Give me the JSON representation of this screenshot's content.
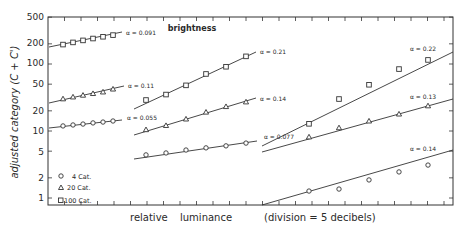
{
  "chart_data": {
    "type": "scatter",
    "title": "brightness",
    "xlabel": "relative luminance (division = 5 decibels)",
    "ylabel": "adjusted category (C + C')",
    "y_scale": "log",
    "ylim": [
      0.8,
      500
    ],
    "y_ticks": [
      1,
      2,
      5,
      10,
      20,
      50,
      100,
      200,
      500
    ],
    "y_tick_labels": [
      "1",
      "2",
      "5",
      "10",
      "20",
      "50",
      "100",
      "200",
      "500"
    ],
    "x_tick_spacing_db": 5,
    "grid": false,
    "legend": {
      "position": "lower-left",
      "entries": [
        {
          "marker": "circle",
          "label": "4 Cat."
        },
        {
          "marker": "triangle",
          "label": "20 Cat."
        },
        {
          "marker": "square",
          "label": "100 Cat."
        }
      ]
    },
    "panels": [
      {
        "name": "panel-1",
        "series": [
          {
            "name": "100 Cat.",
            "marker": "square",
            "alpha_label": "α = 0.091",
            "x_division": [
              1,
              2,
              3,
              4,
              5,
              6
            ],
            "values": [
              195,
              210,
              225,
              240,
              255,
              270
            ]
          },
          {
            "name": "20 Cat.",
            "marker": "triangle",
            "alpha_label": "α = 0.11",
            "x_division": [
              1,
              2,
              3,
              4,
              5,
              6
            ],
            "values": [
              30,
              32,
              34,
              36,
              38,
              42
            ]
          },
          {
            "name": "4 Cat.",
            "marker": "circle",
            "alpha_label": "α = 0.055",
            "x_division": [
              1,
              2,
              3,
              4,
              5,
              6
            ],
            "values": [
              11.9,
              12.3,
              12.7,
              13.2,
              13.6,
              14.1
            ]
          }
        ]
      },
      {
        "name": "panel-2",
        "series": [
          {
            "name": "100 Cat.",
            "marker": "square",
            "alpha_label": "α = 0.21",
            "x_division": [
              6,
              7,
              8,
              9,
              10,
              11
            ],
            "values": [
              29,
              35,
              48,
              71,
              91,
              130
            ]
          },
          {
            "name": "20 Cat.",
            "marker": "triangle",
            "alpha_label": "α = 0.14",
            "x_division": [
              6,
              7,
              8,
              9,
              10,
              11
            ],
            "values": [
              10.4,
              12,
              15,
              19,
              23,
              27
            ]
          },
          {
            "name": "4 Cat.",
            "marker": "circle",
            "alpha_label": "α = 0.055",
            "x_division": [
              6,
              7,
              8,
              9,
              10,
              11
            ],
            "values": [
              4.4,
              4.7,
              5.2,
              5.6,
              6.0,
              6.6
            ]
          }
        ]
      },
      {
        "name": "panel-3",
        "series": [
          {
            "name": "100 Cat.",
            "marker": "square",
            "alpha_label": "α = 0.22",
            "x_division": [
              16,
              18,
              20,
              22,
              24
            ],
            "values": [
              12.8,
              30,
              49,
              84,
              115
            ]
          },
          {
            "name": "20 Cat.",
            "marker": "triangle",
            "alpha_label": "α = 0.13",
            "x_division": [
              16,
              18,
              20,
              22,
              24
            ],
            "values": [
              8.1,
              11.1,
              14,
              17.8,
              23.6
            ]
          },
          {
            "name": "4 Cat.",
            "marker": "circle",
            "alpha_label": "α = 0.14",
            "x_division": [
              16,
              18,
              20,
              22,
              24
            ],
            "values": [
              1.27,
              1.36,
              1.86,
              2.45,
              3.1
            ]
          }
        ]
      }
    ],
    "extra_annotation": "α = 0.077"
  },
  "labels": {
    "title": "brightness",
    "xlabel_1": "relative",
    "xlabel_2": "luminance",
    "xlabel_3": "(division = 5 decibels)",
    "ylabel": "adjusted category (C + C')",
    "legend_4": "4 Cat.",
    "legend_20": "20 Cat.",
    "legend_100": "100 Cat.",
    "y_ticks": [
      "500",
      "200",
      "100",
      "50",
      "20",
      "10",
      "5",
      "2",
      "1"
    ],
    "ann": {
      "p1_sq": "α = 0.091",
      "p1_tr": "α = 0.11",
      "p1_ci": "α = 0.055",
      "p2_sq": "α = 0.21",
      "p2_tr": "α = 0.14",
      "p2_ci": "α = 0.077",
      "p3_sq": "α = 0.22",
      "p3_tr": "α = 0.13",
      "p3_ci": "α = 0.14"
    }
  }
}
